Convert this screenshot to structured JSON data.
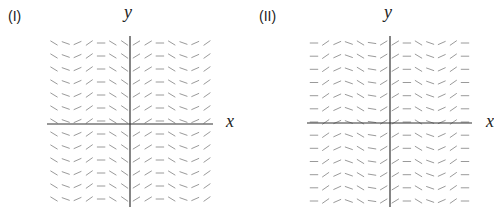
{
  "figure": {
    "panels": [
      {
        "id": "I",
        "label": "(I)",
        "x_axis_label": "x",
        "y_axis_label": "y",
        "type": "slope-field",
        "columns": 14,
        "rows": 13,
        "row_slopes": [
          -0.6,
          -0.35,
          0.45,
          0.7,
          0,
          -0.6,
          -0.7,
          0.6,
          0.6,
          0,
          -0.6,
          -0.35,
          0.45,
          0.7
        ]
      },
      {
        "id": "II",
        "label": "(II)",
        "x_axis_label": "x",
        "y_axis_label": "y",
        "type": "slope-field",
        "columns": 14,
        "rows": 13,
        "row_slopes": [
          0,
          0.7,
          0.45,
          -0.35,
          -0.6,
          -0.15,
          0.6,
          0.6,
          0,
          -0.6,
          -0.35,
          0.45,
          0.7,
          0
        ]
      }
    ],
    "colors": {
      "segments": "#9a9a9a",
      "axes": "#333333",
      "text": "#222222"
    }
  }
}
